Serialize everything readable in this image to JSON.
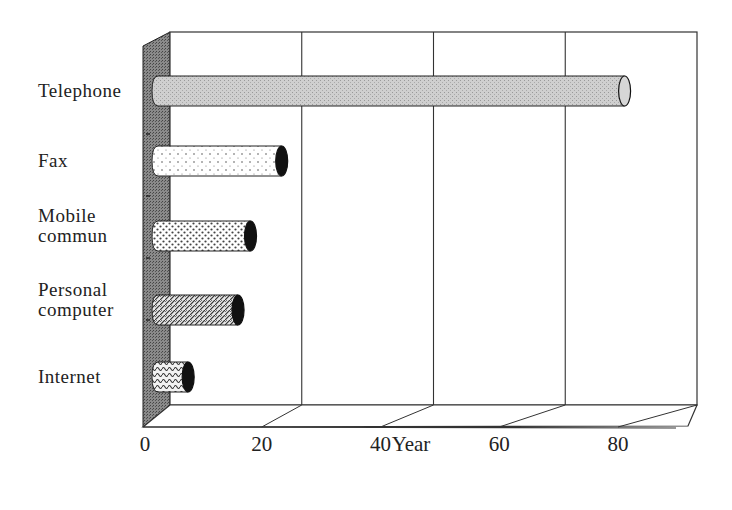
{
  "chart_data": {
    "type": "bar",
    "orientation": "horizontal",
    "style": "3d-cylinder",
    "title": "",
    "xlabel": "Year",
    "ylabel": "",
    "categories": [
      "Telephone",
      "Fax",
      "Mobile commun",
      "Personal computer",
      "Internet"
    ],
    "category_lines": [
      [
        "Telephone"
      ],
      [
        "Fax"
      ],
      [
        "Mobile",
        "commun"
      ],
      [
        "Personal",
        "computer"
      ],
      [
        "Internet"
      ]
    ],
    "values": [
      75,
      20,
      15,
      13,
      5
    ],
    "xlim": [
      0,
      80
    ],
    "xticks": [
      0,
      20,
      40,
      60,
      80
    ],
    "grid": true,
    "legend": null,
    "bar_patterns": [
      "fine-gray",
      "sparse-dots",
      "dense-dots",
      "diagonal-weave",
      "wave-weave"
    ]
  },
  "axis": {
    "tick_labels": [
      "0",
      "20",
      "40",
      "60",
      "80"
    ],
    "x_title": "Year"
  },
  "colors": {
    "wall": "#6e6e6e",
    "grid": "#333333",
    "telephone_fill": "#c8c8c8",
    "cap_dark": "#111111"
  }
}
